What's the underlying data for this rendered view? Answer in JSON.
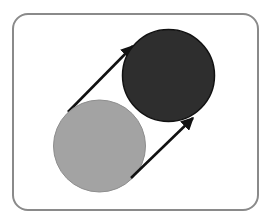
{
  "diagram": {
    "frame": {
      "border_color": "#8a8a8a",
      "background": "#ffffff"
    },
    "circles": [
      {
        "name": "light-circle",
        "cx": 99.5,
        "cy": 146,
        "r": 46,
        "fill": "#a3a3a3",
        "stroke": "#8e8e8e"
      },
      {
        "name": "dark-circle",
        "cx": 168.5,
        "cy": 75.5,
        "r": 46,
        "fill": "#2e2e2e",
        "stroke": "#111111"
      }
    ],
    "arrows": [
      {
        "name": "upper-arrow",
        "x1": 68,
        "y1": 112,
        "x2": 133,
        "y2": 46,
        "color": "#111111"
      },
      {
        "name": "lower-arrow",
        "x1": 131,
        "y1": 178,
        "x2": 193,
        "y2": 118,
        "color": "#111111"
      }
    ]
  }
}
